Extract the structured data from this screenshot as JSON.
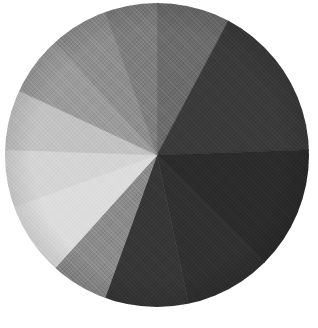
{
  "page": {
    "background_color": "#ffffff",
    "width": 318,
    "height": 328
  },
  "figure": {
    "center_x": 157,
    "center_y": 155,
    "radius_x": 152,
    "radius_y": 152,
    "has_labels": false,
    "has_legend": false,
    "has_title": false,
    "has_border": false,
    "texture": "woven-fabric-halftone"
  },
  "chart_data": {
    "type": "pie",
    "title": "",
    "subtitle": "",
    "xlabel": "",
    "ylabel": "",
    "grid": false,
    "legend_position": "none",
    "labels_shown": false,
    "start_angle_deg": 0,
    "direction": "clockwise",
    "angle_reference": "12 o'clock (north)",
    "total_degrees": 360,
    "categories": [
      "Segment 1",
      "Segment 2",
      "Segment 3",
      "Segment 4",
      "Segment 5",
      "Segment 6",
      "Segment 7",
      "Segment 8",
      "Segment 9",
      "Segment 10",
      "Segment 11",
      "Segment 12"
    ],
    "values": [
      28,
      60,
      47,
      33,
      32,
      22,
      28,
      22,
      23,
      23,
      22,
      20
    ],
    "percentages": [
      7.8,
      16.7,
      13.1,
      9.2,
      8.9,
      6.1,
      7.8,
      6.1,
      6.4,
      6.4,
      6.1,
      5.6
    ],
    "colors": [
      "#6b6b6b",
      "#3a3a3a",
      "#2b2b2b",
      "#303030",
      "#363636",
      "#8a8a8a",
      "#dcdcdc",
      "#d4d4d4",
      "#c2c2c2",
      "#9a9a9a",
      "#8d8d8d",
      "#7d7d7d"
    ],
    "slices": [
      {
        "name": "Segment 1",
        "start_deg": 0,
        "end_deg": 28,
        "sweep_deg": 28,
        "value": 28,
        "percent": 7.8,
        "color": "#6b6b6b"
      },
      {
        "name": "Segment 2",
        "start_deg": 28,
        "end_deg": 88,
        "sweep_deg": 60,
        "value": 60,
        "percent": 16.7,
        "color": "#3a3a3a"
      },
      {
        "name": "Segment 3",
        "start_deg": 88,
        "end_deg": 135,
        "sweep_deg": 47,
        "value": 47,
        "percent": 13.1,
        "color": "#2b2b2b"
      },
      {
        "name": "Segment 4",
        "start_deg": 135,
        "end_deg": 168,
        "sweep_deg": 33,
        "value": 33,
        "percent": 9.2,
        "color": "#303030"
      },
      {
        "name": "Segment 5",
        "start_deg": 168,
        "end_deg": 200,
        "sweep_deg": 32,
        "value": 32,
        "percent": 8.9,
        "color": "#363636"
      },
      {
        "name": "Segment 6",
        "start_deg": 200,
        "end_deg": 222,
        "sweep_deg": 22,
        "value": 22,
        "percent": 6.1,
        "color": "#8a8a8a"
      },
      {
        "name": "Segment 7",
        "start_deg": 222,
        "end_deg": 250,
        "sweep_deg": 28,
        "value": 28,
        "percent": 7.8,
        "color": "#dcdcdc"
      },
      {
        "name": "Segment 8",
        "start_deg": 250,
        "end_deg": 272,
        "sweep_deg": 22,
        "value": 22,
        "percent": 6.1,
        "color": "#d4d4d4"
      },
      {
        "name": "Segment 9",
        "start_deg": 272,
        "end_deg": 295,
        "sweep_deg": 23,
        "value": 23,
        "percent": 6.4,
        "color": "#c2c2c2"
      },
      {
        "name": "Segment 10",
        "start_deg": 295,
        "end_deg": 318,
        "sweep_deg": 23,
        "value": 23,
        "percent": 6.4,
        "color": "#9a9a9a"
      },
      {
        "name": "Segment 11",
        "start_deg": 318,
        "end_deg": 340,
        "sweep_deg": 22,
        "value": 22,
        "percent": 6.1,
        "color": "#8d8d8d"
      },
      {
        "name": "Segment 12",
        "start_deg": 340,
        "end_deg": 360,
        "sweep_deg": 20,
        "value": 20,
        "percent": 5.6,
        "color": "#7d7d7d"
      }
    ]
  }
}
